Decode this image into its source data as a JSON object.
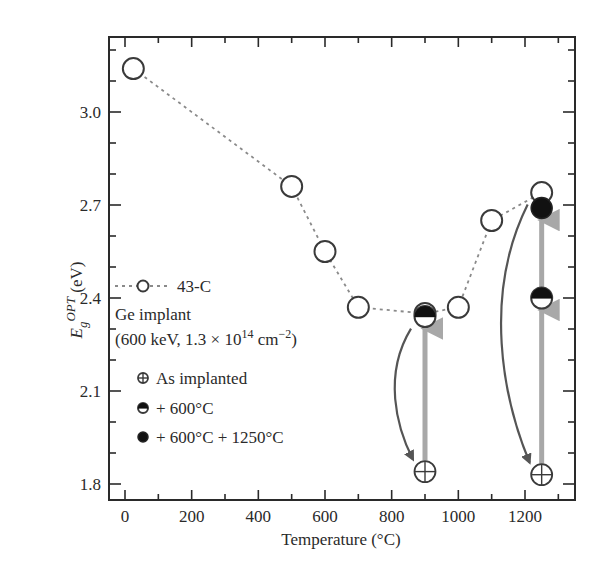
{
  "chart_data": {
    "type": "scatter",
    "title": "",
    "xlabel": "Temperature (°C)",
    "ylabel": "E_g^OPT (eV)",
    "ylabel_parts": {
      "E": "E",
      "sub": "g",
      "sup": "OPT",
      "unit": "(eV)"
    },
    "xlim": [
      -40,
      1340
    ],
    "ylim": [
      1.76,
      3.24
    ],
    "x_ticks": [
      0,
      200,
      400,
      600,
      800,
      1000,
      1200
    ],
    "x_tick_labels": [
      "0",
      "200",
      "400",
      "600",
      "800",
      "1000",
      "1200"
    ],
    "y_ticks": [
      1.8,
      2.1,
      2.4,
      2.7,
      3.0
    ],
    "y_tick_labels": [
      "1.8",
      "2.1",
      "2.4",
      "2.7",
      "3.0"
    ],
    "grid": false,
    "series": [
      {
        "name": "43-C",
        "marker": "open-circle",
        "line": "dotted",
        "x": [
          25,
          500,
          600,
          700,
          900,
          1000,
          1100,
          1250
        ],
        "y": [
          3.14,
          2.76,
          2.55,
          2.37,
          2.35,
          2.37,
          2.65,
          2.74
        ]
      },
      {
        "name": "As implanted",
        "marker": "circle-plus",
        "x": [
          900,
          1250
        ],
        "y": [
          1.84,
          1.83
        ]
      },
      {
        "name": "+ 600°C",
        "marker": "half-filled-circle",
        "x": [
          900,
          1250
        ],
        "y": [
          2.34,
          2.4
        ]
      },
      {
        "name": "+ 600°C + 1250°C",
        "marker": "filled-circle",
        "x": [
          1250
        ],
        "y": [
          2.69
        ]
      }
    ],
    "annotations": {
      "legend_title": "Ge implant",
      "legend_subtitle_prefix": "(600 keV, 1.3 × 10",
      "legend_subtitle_exp": "14",
      "legend_subtitle_unit": " cm",
      "legend_subtitle_unit_exp": "−2",
      "legend_subtitle_suffix": ")",
      "arrows": [
        {
          "type": "curved-dark",
          "from": [
            900,
            2.34
          ],
          "to": [
            900,
            1.84
          ]
        },
        {
          "type": "straight-gray",
          "from": [
            900,
            1.84
          ],
          "to": [
            900,
            2.34
          ]
        },
        {
          "type": "curved-dark",
          "from": [
            1250,
            2.74
          ],
          "to": [
            1250,
            1.83
          ]
        },
        {
          "type": "straight-gray",
          "from": [
            1250,
            1.83
          ],
          "to": [
            1250,
            2.4
          ]
        },
        {
          "type": "straight-gray",
          "from": [
            1250,
            2.4
          ],
          "to": [
            1250,
            2.69
          ]
        }
      ]
    },
    "legend_position": "left-middle"
  },
  "legend": {
    "series_label": "43-C",
    "title": "Ge implant",
    "items": [
      {
        "label": "As implanted"
      },
      {
        "label": "+ 600°C"
      },
      {
        "label": "+ 600°C + 1250°C"
      }
    ]
  },
  "colors": {
    "axis": "#2a2a2a",
    "marker": "#3a3a3a",
    "dotted_line": "#8a8a8a",
    "gray_arrow": "#a8a8a8",
    "dark_arrow": "#555555"
  }
}
